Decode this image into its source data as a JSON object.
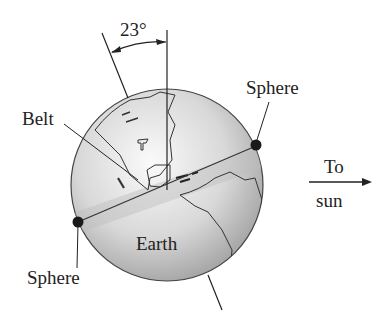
{
  "diagram": {
    "angle_label": "23°",
    "labels": {
      "belt": "Belt",
      "sphere_top": "Sphere",
      "sphere_bottom": "Sphere",
      "earth": "Earth",
      "to": "To",
      "sun": "sun"
    },
    "colors": {
      "line": "#333333",
      "globe_light": "#f4f4f4",
      "globe_dark": "#a9a9a9",
      "belt": "#c8c8c8",
      "dot": "#1a1a1a"
    }
  }
}
